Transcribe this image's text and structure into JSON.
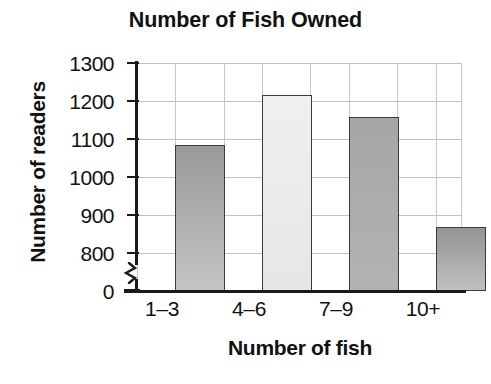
{
  "chart_data": {
    "type": "bar",
    "title": "Number of Fish Owned",
    "xlabel": "Number of fish",
    "ylabel": "Number of readers",
    "categories": [
      "1–3",
      "4–6",
      "7–9",
      "10+"
    ],
    "values": [
      1085,
      1215,
      1158,
      868
    ],
    "ylim": [
      800,
      1300
    ],
    "y_axis_has_break": true,
    "y_break_between": [
      0,
      800
    ],
    "yticks": [
      0,
      800,
      900,
      1000,
      1100,
      1200,
      1300
    ],
    "ytick_labels": [
      "0",
      "800",
      "900",
      "1000",
      "1100",
      "1200",
      "1300"
    ],
    "grid": true,
    "grid_axis": "both",
    "legend": false,
    "legend_position": "none",
    "bars": [
      {
        "category": "1–3",
        "value": 1085,
        "fill_top": "#9a9a9a",
        "fill_bottom": "#c4c4c4",
        "border": "#3a3a3a"
      },
      {
        "category": "4–6",
        "value": 1215,
        "fill_top": "#f0f0f0",
        "fill_bottom": "#e6e6e6",
        "border": "#3a3a3a"
      },
      {
        "category": "7–9",
        "value": 1158,
        "fill_top": "#a6a6a6",
        "fill_bottom": "#b2b2b2",
        "border": "#3a3a3a"
      },
      {
        "category": "10+",
        "value": 868,
        "fill_top": "#949494",
        "fill_bottom": "#c0c0c0",
        "border": "#3a3a3a"
      }
    ],
    "colors": {
      "axis": "#1a1a1a",
      "grid": "#c4c4c4",
      "text": "#111111",
      "background": "#ffffff"
    }
  }
}
